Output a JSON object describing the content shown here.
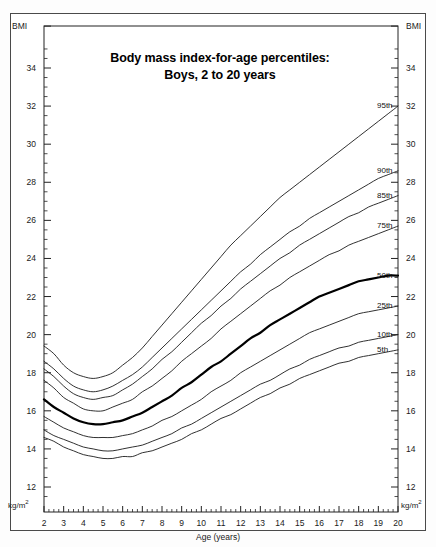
{
  "title": {
    "line1": "Body mass index-for-age percentiles:",
    "line2": "Boys, 2 to 20 years"
  },
  "axis": {
    "x_caption": "Age (years)",
    "y_caption_left": "BMI",
    "y_caption_right": "BMI",
    "unit_left": "kg/m",
    "unit_left_sup": "2",
    "unit_right": "kg/m",
    "unit_right_sup": "2"
  },
  "colors": {
    "frame": "#4a4a4a",
    "axis": "#222222",
    "curve": "#1a1a1a",
    "curve_median": "#000000",
    "background": "#ffffff",
    "text": "#1a1a1a"
  },
  "chart_data": {
    "type": "line",
    "title": "Body mass index-for-age percentiles: Boys, 2 to 20 years",
    "xlabel": "Age (years)",
    "ylabel": "BMI",
    "yunit": "kg/m2",
    "xlim": [
      2,
      20
    ],
    "ylim": [
      12,
      35
    ],
    "grid": false,
    "legend_position": "right-inline-labels",
    "x_ticks": [
      2,
      3,
      4,
      5,
      6,
      7,
      8,
      9,
      10,
      11,
      12,
      13,
      14,
      15,
      16,
      17,
      18,
      19,
      20
    ],
    "x_tick_labels": [
      "2",
      "3",
      "4",
      "5",
      "6",
      "7",
      "8",
      "9",
      "10",
      "11",
      "12",
      "13",
      "14",
      "15",
      "16",
      "17",
      "18",
      "19",
      "20"
    ],
    "x_minor_tick_step": 0.25,
    "y_ticks": [
      12,
      14,
      16,
      18,
      20,
      22,
      24,
      26,
      28,
      30,
      32,
      34
    ],
    "y_tick_labels": [
      "12",
      "14",
      "16",
      "18",
      "20",
      "22",
      "24",
      "26",
      "28",
      "30",
      "32",
      "34"
    ],
    "y_minor_tick_step": 0.5,
    "x": [
      2,
      2.5,
      3,
      3.5,
      4,
      4.5,
      5,
      5.5,
      6,
      6.5,
      7,
      7.5,
      8,
      8.5,
      9,
      9.5,
      10,
      10.5,
      11,
      11.5,
      12,
      12.5,
      13,
      13.5,
      14,
      14.5,
      15,
      15.5,
      16,
      16.5,
      17,
      17.5,
      18,
      18.5,
      19,
      19.5,
      20
    ],
    "series": [
      {
        "name": "95th",
        "label": "95th",
        "emphasis": false,
        "values": [
          19.4,
          19.0,
          18.4,
          18.0,
          17.8,
          17.7,
          17.8,
          18.0,
          18.4,
          18.8,
          19.3,
          19.9,
          20.5,
          21.1,
          21.7,
          22.3,
          22.9,
          23.5,
          24.1,
          24.7,
          25.2,
          25.7,
          26.2,
          26.7,
          27.2,
          27.6,
          28.0,
          28.4,
          28.8,
          29.2,
          29.6,
          30.0,
          30.4,
          30.8,
          31.2,
          31.6,
          32.0
        ]
      },
      {
        "name": "90th",
        "label": "90th",
        "emphasis": false,
        "values": [
          18.6,
          18.2,
          17.7,
          17.3,
          17.1,
          17.0,
          17.1,
          17.3,
          17.6,
          17.9,
          18.3,
          18.8,
          19.3,
          19.8,
          20.3,
          20.8,
          21.3,
          21.8,
          22.3,
          22.8,
          23.3,
          23.7,
          24.2,
          24.6,
          25.0,
          25.4,
          25.7,
          26.1,
          26.4,
          26.7,
          27.0,
          27.3,
          27.6,
          27.9,
          28.2,
          28.4,
          28.6
        ]
      },
      {
        "name": "85th",
        "label": "85th",
        "emphasis": false,
        "values": [
          18.2,
          17.8,
          17.3,
          16.9,
          16.7,
          16.6,
          16.7,
          16.8,
          17.1,
          17.4,
          17.8,
          18.2,
          18.7,
          19.1,
          19.6,
          20.1,
          20.6,
          21.0,
          21.5,
          21.9,
          22.4,
          22.8,
          23.2,
          23.6,
          24.0,
          24.3,
          24.7,
          25.0,
          25.3,
          25.6,
          25.9,
          26.2,
          26.4,
          26.7,
          26.9,
          27.1,
          27.3
        ]
      },
      {
        "name": "75th",
        "label": "75th",
        "emphasis": false,
        "values": [
          17.6,
          17.2,
          16.7,
          16.4,
          16.1,
          16.0,
          16.0,
          16.2,
          16.4,
          16.6,
          17.0,
          17.3,
          17.7,
          18.1,
          18.6,
          19.0,
          19.4,
          19.8,
          20.3,
          20.7,
          21.1,
          21.5,
          21.9,
          22.3,
          22.6,
          23.0,
          23.3,
          23.6,
          23.9,
          24.2,
          24.4,
          24.7,
          24.9,
          25.1,
          25.3,
          25.5,
          25.7
        ]
      },
      {
        "name": "50th",
        "label": "50th",
        "emphasis": true,
        "values": [
          16.6,
          16.2,
          15.9,
          15.6,
          15.4,
          15.3,
          15.3,
          15.4,
          15.5,
          15.7,
          15.9,
          16.2,
          16.5,
          16.8,
          17.2,
          17.5,
          17.9,
          18.3,
          18.6,
          19.0,
          19.4,
          19.8,
          20.1,
          20.5,
          20.8,
          21.1,
          21.4,
          21.7,
          22.0,
          22.2,
          22.4,
          22.6,
          22.8,
          22.9,
          23.0,
          23.1,
          23.1
        ]
      },
      {
        "name": "25th",
        "label": "25th",
        "emphasis": false,
        "values": [
          15.7,
          15.4,
          15.1,
          14.9,
          14.7,
          14.6,
          14.6,
          14.6,
          14.7,
          14.8,
          15.0,
          15.2,
          15.5,
          15.7,
          16.0,
          16.3,
          16.6,
          17.0,
          17.3,
          17.6,
          18.0,
          18.3,
          18.6,
          18.9,
          19.2,
          19.5,
          19.8,
          20.1,
          20.3,
          20.5,
          20.7,
          20.9,
          21.1,
          21.2,
          21.3,
          21.4,
          21.5
        ]
      },
      {
        "name": "10th",
        "label": "10th",
        "emphasis": false,
        "values": [
          15.0,
          14.7,
          14.5,
          14.3,
          14.1,
          14.0,
          13.9,
          13.9,
          14.0,
          14.1,
          14.2,
          14.4,
          14.6,
          14.8,
          15.1,
          15.3,
          15.6,
          15.9,
          16.2,
          16.5,
          16.8,
          17.1,
          17.4,
          17.6,
          17.9,
          18.2,
          18.4,
          18.7,
          18.9,
          19.1,
          19.3,
          19.4,
          19.6,
          19.7,
          19.8,
          19.9,
          20.0
        ]
      },
      {
        "name": "5th",
        "label": "5th",
        "emphasis": false,
        "values": [
          14.6,
          14.4,
          14.1,
          13.9,
          13.7,
          13.6,
          13.5,
          13.5,
          13.6,
          13.6,
          13.8,
          13.9,
          14.1,
          14.3,
          14.5,
          14.8,
          15.0,
          15.3,
          15.6,
          15.8,
          16.1,
          16.4,
          16.7,
          16.9,
          17.2,
          17.4,
          17.7,
          17.9,
          18.1,
          18.3,
          18.5,
          18.6,
          18.8,
          18.9,
          19.0,
          19.1,
          19.2
        ]
      }
    ],
    "percentile_labels": [
      "95th",
      "90th",
      "85th",
      "75th",
      "50th",
      "25th",
      "10th",
      "5th"
    ]
  }
}
